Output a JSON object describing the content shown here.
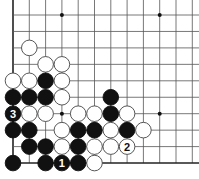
{
  "board": {
    "title": "Go problem diagram",
    "columns": 12,
    "rows": 10,
    "origin_x": 13,
    "origin_y": 15,
    "spacing_x": 16.3,
    "spacing_y": 16.45,
    "edges": {
      "left": true,
      "bottom": true,
      "top": false,
      "right": false
    },
    "star_points": [
      {
        "col": 4,
        "row": 1
      },
      {
        "col": 10,
        "row": 1
      },
      {
        "col": 4,
        "row": 7
      },
      {
        "col": 10,
        "row": 7
      }
    ],
    "stones": [
      {
        "col": 2,
        "row": 3,
        "color": "white"
      },
      {
        "col": 3,
        "row": 4,
        "color": "white"
      },
      {
        "col": 4,
        "row": 4,
        "color": "white"
      },
      {
        "col": 1,
        "row": 5,
        "color": "white"
      },
      {
        "col": 2,
        "row": 5,
        "color": "white"
      },
      {
        "col": 3,
        "row": 5,
        "color": "black"
      },
      {
        "col": 4,
        "row": 5,
        "color": "white"
      },
      {
        "col": 1,
        "row": 6,
        "color": "black"
      },
      {
        "col": 2,
        "row": 6,
        "color": "black"
      },
      {
        "col": 3,
        "row": 6,
        "color": "black"
      },
      {
        "col": 4,
        "row": 6,
        "color": "white"
      },
      {
        "col": 7,
        "row": 6,
        "color": "black"
      },
      {
        "col": 1,
        "row": 7,
        "color": "black",
        "label": "3"
      },
      {
        "col": 2,
        "row": 7,
        "color": "white"
      },
      {
        "col": 3,
        "row": 7,
        "color": "white"
      },
      {
        "col": 5,
        "row": 7,
        "color": "white"
      },
      {
        "col": 6,
        "row": 7,
        "color": "white"
      },
      {
        "col": 7,
        "row": 7,
        "color": "black"
      },
      {
        "col": 8,
        "row": 7,
        "color": "white"
      },
      {
        "col": 1,
        "row": 8,
        "color": "black"
      },
      {
        "col": 2,
        "row": 8,
        "color": "black"
      },
      {
        "col": 4,
        "row": 8,
        "color": "white"
      },
      {
        "col": 5,
        "row": 8,
        "color": "black"
      },
      {
        "col": 6,
        "row": 8,
        "color": "black"
      },
      {
        "col": 7,
        "row": 8,
        "color": "white"
      },
      {
        "col": 8,
        "row": 8,
        "color": "black"
      },
      {
        "col": 9,
        "row": 8,
        "color": "white"
      },
      {
        "col": 2,
        "row": 9,
        "color": "black"
      },
      {
        "col": 3,
        "row": 9,
        "color": "black"
      },
      {
        "col": 4,
        "row": 9,
        "color": "white"
      },
      {
        "col": 5,
        "row": 9,
        "color": "black"
      },
      {
        "col": 6,
        "row": 9,
        "color": "white"
      },
      {
        "col": 7,
        "row": 9,
        "color": "white"
      },
      {
        "col": 8,
        "row": 9,
        "color": "white",
        "label": "2"
      },
      {
        "col": 1,
        "row": 10,
        "color": "black"
      },
      {
        "col": 3,
        "row": 10,
        "color": "black"
      },
      {
        "col": 4,
        "row": 10,
        "color": "black",
        "label": "1"
      },
      {
        "col": 5,
        "row": 10,
        "color": "black"
      },
      {
        "col": 6,
        "row": 10,
        "color": "white"
      }
    ],
    "colors": {
      "line": "#555555",
      "edge": "#222222",
      "black_stone": "#111111",
      "white_stone": "#ffffff",
      "white_outline": "#444444"
    }
  }
}
